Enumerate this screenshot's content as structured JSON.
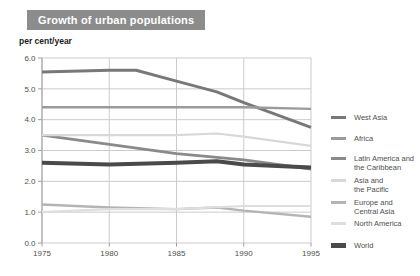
{
  "header": {
    "title": "Growth of urban populations",
    "unit_label": "per cent/year"
  },
  "colors": {
    "title_bg": "#8c8c8c",
    "title_text": "#ffffff",
    "grid": "#cbcbcb",
    "axis": "#9e9e9e",
    "tick_text": "#4f4f4f",
    "legend_text": "#4f4f4f"
  },
  "chart_data": {
    "type": "line",
    "title": "Growth of urban populations",
    "ylabel": "per cent/year",
    "xlabel": "",
    "xlim": [
      1975,
      1995
    ],
    "ylim": [
      0,
      6
    ],
    "xticks": [
      "1975",
      "1980",
      "1985",
      "1990",
      "1995"
    ],
    "yticks": [
      "0.0",
      "1.0",
      "2.0",
      "3.0",
      "4.0",
      "5.0",
      "6.0"
    ],
    "grid": true,
    "legend_position": "right",
    "series": [
      {
        "name": "West Asia",
        "color": "#787878",
        "width": 3,
        "x": [
          1975,
          1980,
          1982,
          1985,
          1988,
          1990,
          1995
        ],
        "y": [
          5.55,
          5.6,
          5.6,
          5.25,
          4.9,
          4.55,
          3.75
        ]
      },
      {
        "name": "Africa",
        "color": "#9b9b9b",
        "width": 2.4,
        "x": [
          1975,
          1980,
          1985,
          1990,
          1995
        ],
        "y": [
          4.4,
          4.4,
          4.4,
          4.4,
          4.35
        ]
      },
      {
        "name": "Latin America and\nthe Caribbean",
        "color": "#8a8a8a",
        "width": 2.8,
        "x": [
          1975,
          1980,
          1985,
          1990,
          1995
        ],
        "y": [
          3.5,
          3.2,
          2.9,
          2.7,
          2.4
        ]
      },
      {
        "name": "Asia and\nthe Pacific",
        "color": "#d8d8d8",
        "width": 2.2,
        "x": [
          1975,
          1980,
          1985,
          1988,
          1990,
          1995
        ],
        "y": [
          3.5,
          3.5,
          3.5,
          3.55,
          3.45,
          3.15
        ]
      },
      {
        "name": "Europe and\nCentral Asia",
        "color": "#b4b4b4",
        "width": 2.4,
        "x": [
          1975,
          1980,
          1985,
          1988,
          1990,
          1995
        ],
        "y": [
          1.25,
          1.15,
          1.1,
          1.15,
          1.05,
          0.85
        ]
      },
      {
        "name": "North America",
        "color": "#dedede",
        "width": 2.2,
        "x": [
          1975,
          1980,
          1985,
          1990,
          1995
        ],
        "y": [
          1.0,
          1.1,
          1.1,
          1.2,
          1.2
        ]
      },
      {
        "name": "World",
        "color": "#4a4a4a",
        "width": 4,
        "x": [
          1975,
          1980,
          1985,
          1988,
          1990,
          1995
        ],
        "y": [
          2.6,
          2.55,
          2.6,
          2.65,
          2.55,
          2.45
        ]
      }
    ]
  }
}
